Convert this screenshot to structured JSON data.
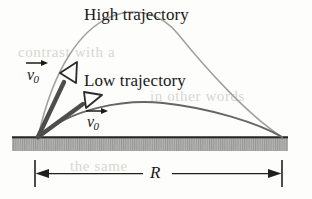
{
  "figure": {
    "kind": "projectile-trajectory-diagram",
    "background_color": "#fdfdfc",
    "labels": {
      "high_trajectory": "High trajectory",
      "low_trajectory": "Low trajectory",
      "v0_high": "v",
      "v0_high_sub": "0",
      "v0_low": "v",
      "v0_low_sub": "0",
      "range": "R"
    },
    "colors": {
      "high_curve": "#9a9a9a",
      "low_curve": "#6b6b6b",
      "vector": "#4a4a4a",
      "arrowhead_fill": "#ffffff",
      "ground_fill": "#b0b0ae",
      "ground_line": "#2a2a28",
      "text": "#1a1a18",
      "dimension_line": "#1a1a18"
    },
    "geometry": {
      "launch_point": [
        38,
        137
      ],
      "landing_point": [
        282,
        137
      ],
      "high_apex": [
        160,
        38
      ],
      "low_apex": [
        163,
        104
      ],
      "ground_top": 137,
      "ground_bottom": 151,
      "ground_left": 12,
      "ground_right": 288,
      "dimension_y": 173,
      "dimension_left_x": 35,
      "dimension_right_x": 282,
      "high_vector_angle_deg": 63,
      "low_vector_angle_deg": 38
    },
    "bleed_through": [
      "contrast with a",
      "in other words",
      "the same"
    ]
  }
}
